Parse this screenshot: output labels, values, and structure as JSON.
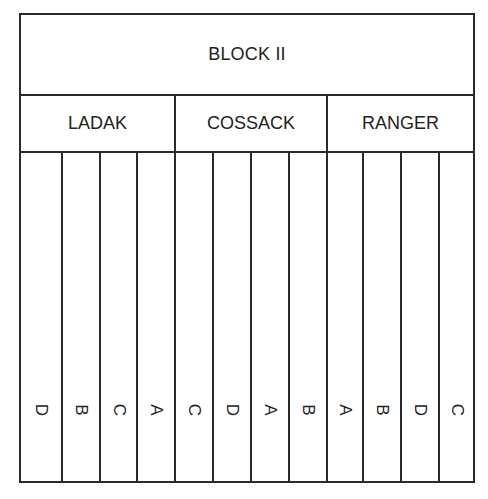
{
  "block": {
    "title": "BLOCK II"
  },
  "groups": [
    {
      "name": "LADAK",
      "plots": [
        {
          "label": "D"
        },
        {
          "label": "B"
        },
        {
          "label": "C"
        },
        {
          "label": "A"
        }
      ]
    },
    {
      "name": "COSSACK",
      "plots": [
        {
          "label": "C"
        },
        {
          "label": "D"
        },
        {
          "label": "A"
        },
        {
          "label": "B"
        }
      ]
    },
    {
      "name": "RANGER",
      "plots": [
        {
          "label": "A"
        },
        {
          "label": "B"
        },
        {
          "label": "D"
        },
        {
          "label": "C"
        }
      ]
    }
  ],
  "colors": {
    "line": "#2a2a2a",
    "text": "#222222",
    "background": "#ffffff"
  }
}
